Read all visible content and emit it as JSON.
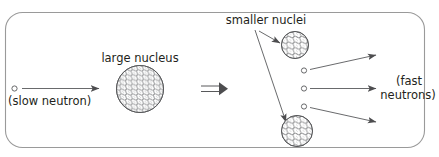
{
  "figure": {
    "name": "nuclear-fission-diagram",
    "border_color": "#8a8a8a",
    "stroke_color": "#58595b",
    "nucleon_color": "#6d6e71",
    "background": "#ffffff",
    "labels": {
      "slow_neutron": "(slow neutron)",
      "large_nucleus": "large nucleus",
      "smaller_nuclei": "smaller nuclei",
      "fast_neutrons_line1": "(fast",
      "fast_neutrons_line2": "neutrons)"
    },
    "symbols": {
      "implies": "⟹"
    },
    "elements": {
      "incoming_neutron": "slow-neutron-particle",
      "large_nucleus": "large-nucleus-circle",
      "upper_fragment": "smaller-nucleus-upper",
      "lower_fragment": "smaller-nucleus-lower",
      "emitted_neutron_1": "fast-neutron-1",
      "emitted_neutron_2": "fast-neutron-2",
      "emitted_neutron_3": "fast-neutron-3"
    }
  }
}
